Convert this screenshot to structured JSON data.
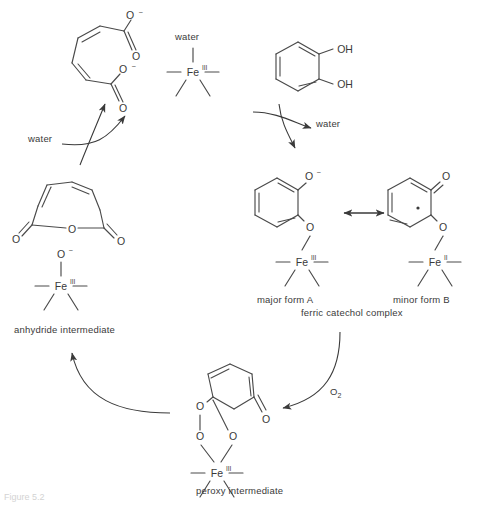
{
  "figure": {
    "caption_fragment": "Figure 5.2"
  },
  "labels": {
    "water_left": "water",
    "water_top_fe": "water",
    "water_right": "water",
    "dioxygen": "O2",
    "dioxygen_base": "O",
    "dioxygen_sub": "2",
    "anhydride_intermediate": "anhydride intermediate",
    "peroxy_intermediate": "peroxy intermediate",
    "major_form": "major form A",
    "minor_form": "minor form B",
    "ferric_catechol_complex": "ferric catechol complex"
  },
  "atoms": {
    "oxygen": "O",
    "hydroxyl": "OH",
    "iron": "Fe",
    "oxidation_three": "III",
    "oxidation_two": "II",
    "minus": "–"
  },
  "structures": [
    {
      "id": "muconate",
      "name": "cis,cis-muconate dianion",
      "position": "top-left",
      "groups": [
        "O–",
        "O",
        "O–",
        "O"
      ]
    },
    {
      "id": "fe3-water",
      "name": "aqua ferric enzyme",
      "position": "top-center",
      "metal": "Fe",
      "oxidation": "III",
      "axial_ligand": "water"
    },
    {
      "id": "catechol",
      "name": "catechol",
      "position": "top-right",
      "groups": [
        "OH",
        "OH"
      ]
    },
    {
      "id": "anhydride",
      "name": "muconic anhydride",
      "position": "mid-left",
      "groups": [
        "O",
        "O",
        "O"
      ]
    },
    {
      "id": "fe3-oxo",
      "name": "anhydride intermediate iron centre",
      "position": "mid-left-lower",
      "metal": "Fe",
      "oxidation": "III",
      "axial_ligand": "O–"
    },
    {
      "id": "form-a",
      "name": "major form A ferric catecholate",
      "position": "center-right",
      "metal": "Fe",
      "oxidation": "III",
      "groups": [
        "O–",
        "O"
      ]
    },
    {
      "id": "form-b",
      "name": "minor form B ferrous semiquinone",
      "position": "right",
      "metal": "Fe",
      "oxidation": "II",
      "groups": [
        "O",
        "O"
      ],
      "radical": true
    },
    {
      "id": "peroxy",
      "name": "peroxy intermediate",
      "position": "bottom-center",
      "metal": "Fe",
      "oxidation": "III",
      "groups": [
        "O",
        "O",
        "O",
        "O"
      ]
    }
  ],
  "arrows": [
    {
      "id": "water-in-left",
      "label": "water",
      "kind": "curved"
    },
    {
      "id": "muconate-release",
      "label": "",
      "kind": "curved"
    },
    {
      "id": "water-out-right",
      "label": "water",
      "kind": "curved"
    },
    {
      "id": "catechol-bind",
      "label": "",
      "kind": "curved"
    },
    {
      "id": "resonance",
      "label": "",
      "kind": "double-headed"
    },
    {
      "id": "oxygen-addition",
      "label": "O2",
      "kind": "curved"
    },
    {
      "id": "peroxy-to-anhydride",
      "label": "",
      "kind": "curved"
    }
  ]
}
